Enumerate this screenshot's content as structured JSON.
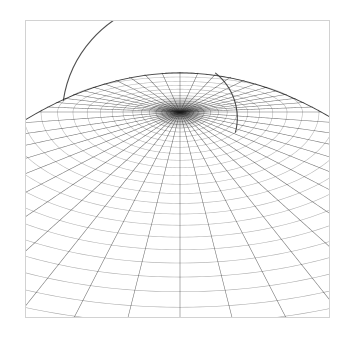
{
  "figure": {
    "title": "",
    "background_color": "#ffffff",
    "width": 358,
    "height": 338
  },
  "frame": {
    "name": "plot-frame",
    "x": 25,
    "y": 20,
    "width": 305,
    "height": 298,
    "border_color": "#d2d2d2",
    "border_width": 1,
    "fill_color": "#ffffff"
  },
  "chart_data": {
    "type": "line",
    "title": "",
    "subtitle": "",
    "xlabel": "",
    "ylabel": "",
    "grid": true,
    "legend": null,
    "projection": "perspective",
    "surface": "sphere",
    "line_color": "#1a1a1a",
    "line_width": 0.55,
    "pole": {
      "x": 180,
      "y": 112
    },
    "camera": {
      "eye_height_ratio": 0.22,
      "horizon_y": 74,
      "focal_scale": 1.0
    },
    "mesh": {
      "meridian_count": 48,
      "parallel_count": 44,
      "meridian_angle_step_deg": 7.5,
      "parallel_angle_step_deg": 2.0,
      "parallel_angle_min_deg": 0,
      "parallel_angle_max_deg": 88
    },
    "silhouette": {
      "top_y": 73,
      "left_x": 27,
      "right_x": 331,
      "rim_darkness": 0.92
    },
    "series": [
      {
        "name": "meridians",
        "values": []
      },
      {
        "name": "parallels",
        "values": []
      }
    ],
    "annotations": [
      {
        "label": "occluding-arc-right",
        "x": 236,
        "y": 124
      },
      {
        "label": "occluding-arc-left",
        "x": 62,
        "y": 118
      }
    ]
  }
}
